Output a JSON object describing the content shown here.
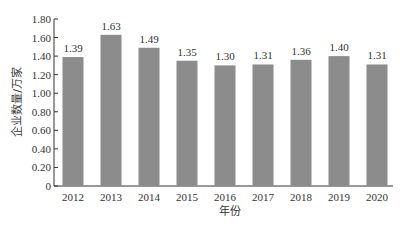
{
  "chart_data": {
    "type": "bar",
    "title": "",
    "categories": [
      "2012",
      "2013",
      "2014",
      "2015",
      "2016",
      "2017",
      "2018",
      "2019",
      "2020"
    ],
    "values": [
      1.39,
      1.63,
      1.49,
      1.35,
      1.3,
      1.31,
      1.36,
      1.4,
      1.31
    ],
    "value_labels": [
      "1.39",
      "1.63",
      "1.49",
      "1.35",
      "1.30",
      "1.31",
      "1.36",
      "1.40",
      "1.31"
    ],
    "xlabel": "年份",
    "ylabel": "企业数量/万家",
    "ylim": [
      0,
      1.8
    ],
    "yticks": [
      "0",
      "0.20",
      "0.40",
      "0.60",
      "0.80",
      "1.00",
      "1.20",
      "1.40",
      "1.60",
      "1.80"
    ],
    "grid": false,
    "legend": "none",
    "bar_color": "#8c8c8c"
  }
}
